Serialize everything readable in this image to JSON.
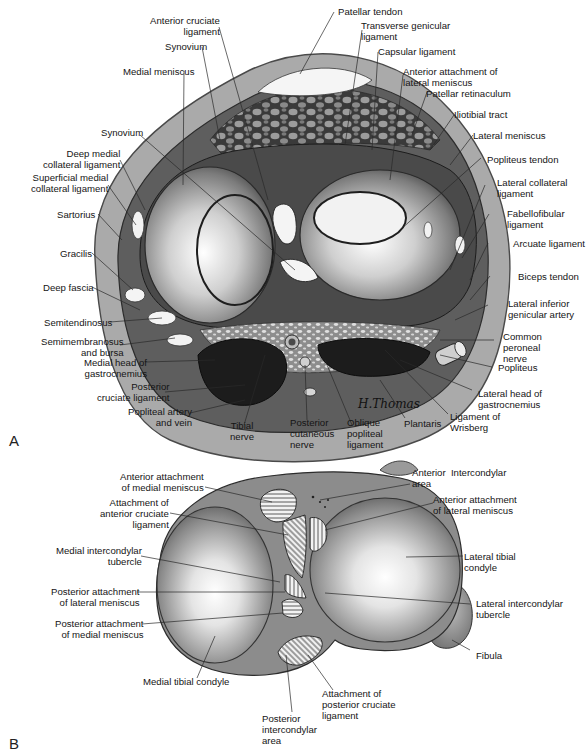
{
  "figure": {
    "panels": [
      {
        "id": "A",
        "letter": "A",
        "description": "Transverse section of knee joint above tibial plateau",
        "signature": "H.Thomas",
        "labels": [
          {
            "key": "patellar_tendon",
            "text": "Patellar tendon"
          },
          {
            "key": "anterior_cruciate_ligament",
            "text": "Anterior cruciate\nligament"
          },
          {
            "key": "transverse_genicular_ligament",
            "text": "Transverse genicular\nligament"
          },
          {
            "key": "synovium_top",
            "text": "Synovium"
          },
          {
            "key": "capsular_ligament",
            "text": "Capsular ligament"
          },
          {
            "key": "medial_meniscus",
            "text": "Medial meniscus"
          },
          {
            "key": "anterior_attachment_lateral_meniscus",
            "text": "Anterior attachment of\nlateral meniscus"
          },
          {
            "key": "patellar_retinaculum",
            "text": "Patellar retinaculum"
          },
          {
            "key": "iliotibial_tract",
            "text": "Iliotibial tract"
          },
          {
            "key": "synovium_left",
            "text": "Synovium"
          },
          {
            "key": "lateral_meniscus",
            "text": "Lateral meniscus"
          },
          {
            "key": "deep_medial_collateral_ligament",
            "text": "Deep medial\ncollateral ligament"
          },
          {
            "key": "popliteus_tendon",
            "text": "Popliteus tendon"
          },
          {
            "key": "superficial_medial_collateral_ligament",
            "text": "Superficial medial\ncollateral ligament"
          },
          {
            "key": "lateral_collateral_ligament",
            "text": "Lateral collateral\nligament"
          },
          {
            "key": "sartorius",
            "text": "Sartorius"
          },
          {
            "key": "fabellofibular_ligament",
            "text": "Fabellofibular\nligament"
          },
          {
            "key": "gracilis",
            "text": "Gracilis"
          },
          {
            "key": "arcuate_ligament",
            "text": "Arcuate ligament"
          },
          {
            "key": "deep_fascia",
            "text": "Deep fascia"
          },
          {
            "key": "biceps_tendon",
            "text": "Biceps tendon"
          },
          {
            "key": "semitendinosus",
            "text": "Semitendinosus"
          },
          {
            "key": "lateral_inferior_genicular_artery",
            "text": "Lateral inferior\ngenicular artery"
          },
          {
            "key": "semimembranosus_and_bursa",
            "text": "Semimembranosus\nand bursa"
          },
          {
            "key": "common_peroneal_nerve",
            "text": "Common\nperoneal\nnerve"
          },
          {
            "key": "medial_head_gastrocnemius",
            "text": "Medial head of\ngastrocnemius"
          },
          {
            "key": "popliteus",
            "text": "Popliteus"
          },
          {
            "key": "posterior_cruciate_ligament",
            "text": "Posterior\ncruciate ligament"
          },
          {
            "key": "lateral_head_gastrocnemius",
            "text": "Lateral head of\ngastrocnemius"
          },
          {
            "key": "popliteal_artery_and_vein",
            "text": "Popliteal artery\nand vein"
          },
          {
            "key": "tibial_nerve",
            "text": "Tibial\nnerve"
          },
          {
            "key": "posterior_cutaneous_nerve",
            "text": "Posterior\ncutaneous\nnerve"
          },
          {
            "key": "oblique_popliteal_ligament",
            "text": "Oblique\npopliteal\nligament"
          },
          {
            "key": "plantaris",
            "text": "Plantaris"
          },
          {
            "key": "ligament_of_wrisberg",
            "text": "Ligament of\nWrisberg"
          }
        ]
      },
      {
        "id": "B",
        "letter": "B",
        "description": "Superior view of tibial plateau showing attachments",
        "labels": [
          {
            "key": "anterior_attachment_medial_meniscus",
            "text": "Anterior attachment\nof medial meniscus"
          },
          {
            "key": "anterior_intercondylar_area",
            "text": "Anterior  Intercondylar\narea"
          },
          {
            "key": "attachment_anterior_cruciate",
            "text": "Attachment of\nanterior cruciate\nligament"
          },
          {
            "key": "anterior_attachment_lateral_meniscus",
            "text": "Anterior attachment\nof lateral meniscus"
          },
          {
            "key": "medial_intercondylar_tubercle",
            "text": "Medial intercondylar\ntubercle"
          },
          {
            "key": "lateral_tibial_condyle",
            "text": "Lateral tibial\ncondyle"
          },
          {
            "key": "posterior_attachment_lateral_meniscus",
            "text": "Posterior attachment\nof lateral meniscus"
          },
          {
            "key": "lateral_intercondylar_tubercle",
            "text": "Lateral intercondylar\ntubercle"
          },
          {
            "key": "posterior_attachment_medial_meniscus",
            "text": "Posterior attachment\nof medial meniscus"
          },
          {
            "key": "fibula",
            "text": "Fibula"
          },
          {
            "key": "medial_tibial_condyle",
            "text": "Medial tibial condyle"
          },
          {
            "key": "attachment_posterior_cruciate",
            "text": "Attachment of\nposterior cruciate\nligament"
          },
          {
            "key": "posterior_intercondylar_area",
            "text": "Posterior\nintercondylar\narea"
          }
        ]
      }
    ]
  },
  "colors": {
    "background": "#ffffff",
    "skin": "#a9a9a9",
    "skin_edge": "#5a5a5a",
    "muscle_dark": "#1e1e1e",
    "bone_light": "#e6e6e6",
    "bone_mid": "#9a9a9a",
    "leader_line": "#2a2a2a"
  }
}
